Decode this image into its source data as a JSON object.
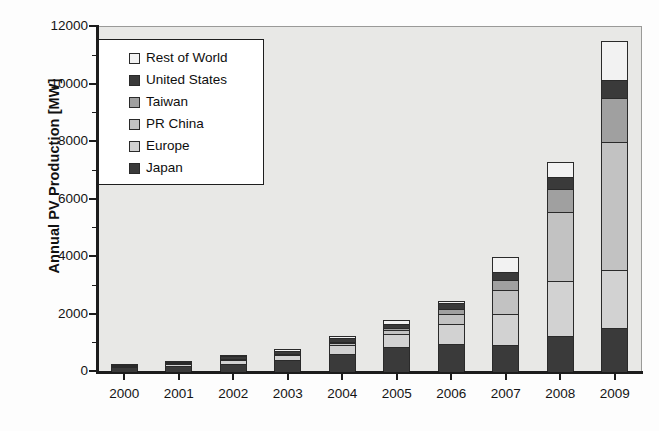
{
  "chart_data": {
    "type": "bar",
    "subtype": "stacked-bar",
    "title": "",
    "xlabel": "",
    "ylabel": "Annual PV Production [MW]",
    "ylim": [
      0,
      12000
    ],
    "ytick_values": [
      0,
      2000,
      4000,
      6000,
      8000,
      10000,
      12000
    ],
    "ytick_labels": [
      "0",
      "2000",
      "4000",
      "6000",
      "8000",
      "10000",
      "12000"
    ],
    "yminor_values": [
      1000,
      3000,
      5000,
      7000,
      9000,
      11000
    ],
    "grid": false,
    "legend_position": "upper-left-inside",
    "stack_order_bottom_to_top": [
      "Japan",
      "Europe",
      "PR China",
      "Taiwan",
      "United States",
      "Rest of World"
    ],
    "categories": [
      "2000",
      "2001",
      "2002",
      "2003",
      "2004",
      "2005",
      "2006",
      "2007",
      "2008",
      "2009"
    ],
    "series": [
      {
        "name": "Japan",
        "color": "#3a3a3a",
        "values": [
          130,
          170,
          250,
          365,
          600,
          830,
          925,
          920,
          1230,
          1500
        ]
      },
      {
        "name": "Europe",
        "color": "#d2d2d2",
        "values": [
          60,
          90,
          140,
          190,
          320,
          470,
          700,
          1070,
          1900,
          2000
        ]
      },
      {
        "name": "PR China",
        "color": "#c2c2c2",
        "values": [
          5,
          10,
          20,
          30,
          60,
          130,
          370,
          820,
          2400,
          4450
        ]
      },
      {
        "name": "Taiwan",
        "color": "#a0a0a0",
        "values": [
          0,
          0,
          5,
          10,
          30,
          60,
          160,
          370,
          800,
          1550
        ]
      },
      {
        "name": "United States",
        "color": "#3a3a3a",
        "values": [
          40,
          60,
          90,
          105,
          140,
          155,
          210,
          280,
          420,
          620
        ]
      },
      {
        "name": "Rest of World",
        "color": "#f2f2f2",
        "values": [
          20,
          30,
          45,
          55,
          80,
          115,
          70,
          500,
          520,
          1350
        ]
      }
    ],
    "totals": [
      255,
      360,
      550,
      755,
      1230,
      1760,
      2435,
      3960,
      7270,
      11470
    ]
  },
  "legend": {
    "items": [
      {
        "label": "Rest of World",
        "swatch_color": "#f2f2f2"
      },
      {
        "label": "United States",
        "swatch_color": "#3a3a3a"
      },
      {
        "label": "Taiwan",
        "swatch_color": "#a0a0a0"
      },
      {
        "label": "PR China",
        "swatch_color": "#c2c2c2"
      },
      {
        "label": "Europe",
        "swatch_color": "#d2d2d2"
      },
      {
        "label": "Japan",
        "swatch_color": "#3a3a3a"
      }
    ]
  },
  "axes": {
    "y_title": "Annual PV Production [MW]"
  }
}
